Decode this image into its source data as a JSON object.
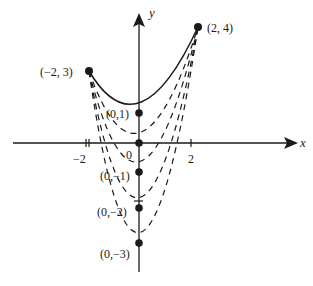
{
  "diagram": {
    "type": "family-of-parabolas",
    "axes": {
      "x_label": "x",
      "y_label": "y",
      "tick_labels": {
        "neg2": "−2",
        "origin": "0",
        "pos2": "2"
      }
    },
    "endpoints": {
      "left": {
        "label": "(−2, 3)",
        "x": -2,
        "y": 3
      },
      "right": {
        "label": "(2, 4)",
        "x": 2,
        "y": 4
      }
    },
    "vertices": [
      {
        "label": "(0,1)",
        "x": 0,
        "y": 1,
        "style": "solid"
      },
      {
        "label": "",
        "x": 0,
        "y": 0,
        "style": "dashed"
      },
      {
        "label": "(0,−1)",
        "x": 0,
        "y": -1,
        "style": "dashed"
      },
      {
        "label": "(0,−2)",
        "x": 0,
        "y": -2,
        "style": "dashed"
      },
      {
        "label": "(0,−3)",
        "x": 0,
        "y": -3,
        "style": "dashed"
      }
    ],
    "colors": {
      "ink": "#1a1a1a",
      "background": "#ffffff"
    }
  }
}
